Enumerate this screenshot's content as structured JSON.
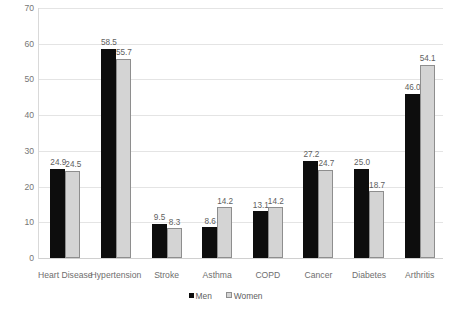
{
  "chart_data": {
    "type": "bar",
    "title": "",
    "subtitle": "",
    "xlabel": "",
    "ylabel": "",
    "ylim": [
      0,
      70
    ],
    "ytick_step": 10,
    "yticks": [
      "0",
      "10",
      "20",
      "30",
      "40",
      "50",
      "60",
      "70"
    ],
    "grid": true,
    "legend_position": "bottom",
    "categories": [
      "Heart Disease",
      "Hypertension",
      "Stroke",
      "Asthma",
      "COPD",
      "Cancer",
      "Diabetes",
      "Arthritis"
    ],
    "series": [
      {
        "name": "Men",
        "color": "#0d0d0d",
        "values": [
          24.9,
          58.5,
          9.5,
          8.6,
          13.1,
          27.2,
          25.0,
          46.0
        ],
        "labels": [
          "24.9",
          "58.5",
          "9.5",
          "8.6",
          "13.1",
          "27.2",
          "25.0",
          "46.0"
        ]
      },
      {
        "name": "Women",
        "color": "#d4d4d4",
        "values": [
          24.5,
          55.7,
          8.3,
          14.2,
          14.2,
          24.7,
          18.7,
          54.1
        ],
        "labels": [
          "24.5",
          "55.7",
          "8.3",
          "14.2",
          "14.2",
          "24.7",
          "18.7",
          "54.1"
        ]
      }
    ]
  },
  "legend": {
    "items": [
      {
        "label": "Men",
        "swatch": "men-swatch-icon"
      },
      {
        "label": "Women",
        "swatch": "women-swatch-icon"
      }
    ]
  }
}
